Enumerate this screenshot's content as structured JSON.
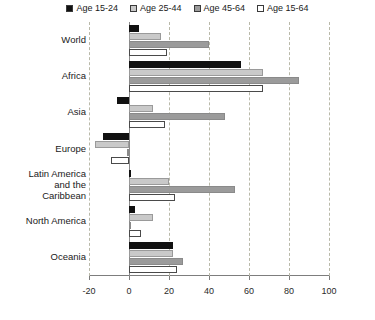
{
  "chart_data": {
    "type": "bar",
    "orientation": "horizontal",
    "title": "",
    "xlabel": "",
    "ylabel": "",
    "xlim": [
      -20,
      100
    ],
    "xticks": [
      -20,
      0,
      20,
      40,
      60,
      80,
      100
    ],
    "xtick_labels": [
      "-20",
      "0",
      "20",
      "40",
      "60",
      "80",
      "100"
    ],
    "grid": true,
    "legend_position": "top",
    "categories": [
      "World",
      "Africa",
      "Asia",
      "Europe",
      "Latin America and the Caribbean",
      "North America",
      "Oceania"
    ],
    "category_labels": [
      "World",
      "Africa",
      "Asia",
      "Europe",
      "Latin America\nand the\nCaribbean",
      "North America",
      "Oceania"
    ],
    "series": [
      {
        "name": "Age 15-24",
        "color": "#111111",
        "values": [
          5,
          56,
          -6,
          -13,
          1,
          3,
          22
        ]
      },
      {
        "name": "Age 25-44",
        "color": "#c9c9c9",
        "values": [
          16,
          67,
          12,
          -17,
          20,
          12,
          22
        ]
      },
      {
        "name": "Age 45-64",
        "color": "#9b9b9b",
        "values": [
          40,
          85,
          48,
          -1,
          53,
          1,
          27
        ]
      },
      {
        "name": "Age 15-64",
        "color": "#ffffff",
        "values": [
          19,
          67,
          18,
          -9,
          23,
          6,
          24
        ]
      }
    ]
  },
  "legend": {
    "items": [
      {
        "label": "Age 15-24",
        "color": "#111111"
      },
      {
        "label": "Age 25-44",
        "color": "#c9c9c9"
      },
      {
        "label": "Age 45-64",
        "color": "#9b9b9b"
      },
      {
        "label": "Age 15-64",
        "color": "#ffffff"
      }
    ]
  }
}
